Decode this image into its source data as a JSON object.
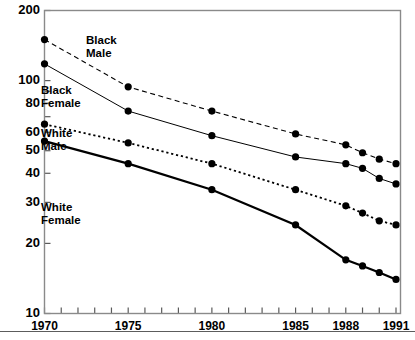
{
  "chart_data": {
    "type": "line",
    "title": "",
    "subtitle": "",
    "xlabel": "",
    "ylabel": "",
    "yscale": "log",
    "ylim": [
      10,
      200
    ],
    "xlim": [
      1970,
      1991
    ],
    "grid": false,
    "legend_position": "inline-annotations",
    "y_ticks": [
      200,
      100,
      80,
      60,
      50,
      40,
      30,
      20,
      10
    ],
    "y_tick_labels": [
      "200",
      "100",
      "80",
      "60",
      "50",
      "40",
      "30",
      "20",
      "10"
    ],
    "x_ticks": [
      1970,
      1971,
      1972,
      1973,
      1974,
      1975,
      1976,
      1977,
      1978,
      1979,
      1980,
      1981,
      1982,
      1983,
      1984,
      1985,
      1986,
      1987,
      1988,
      1989,
      1990,
      1991
    ],
    "x_tick_labels_shown": [
      "1970",
      "1975",
      "1980",
      "1985",
      "1988",
      "1991"
    ],
    "x_labeled_years": [
      1970,
      1975,
      1980,
      1985,
      1988,
      1991
    ],
    "series": [
      {
        "name": "Black Male",
        "label": "Black\nMale",
        "label_line1": "Black",
        "label_line2": "Male",
        "linestyle": "dashed",
        "color": "#000000",
        "x": [
          1970,
          1975,
          1980,
          1985,
          1988,
          1989,
          1990,
          1991
        ],
        "values": [
          150,
          94,
          74,
          59,
          53,
          49,
          46,
          44
        ]
      },
      {
        "name": "Black Female",
        "label": "Black\nFemale",
        "label_line1": "Black",
        "label_line2": "Female",
        "linestyle": "solid-thin",
        "color": "#000000",
        "x": [
          1970,
          1975,
          1980,
          1985,
          1988,
          1989,
          1990,
          1991
        ],
        "values": [
          118,
          74,
          58,
          47,
          44,
          42,
          38,
          36
        ]
      },
      {
        "name": "White Male",
        "label": "White\nMale",
        "label_line1": "White",
        "label_line2": "Male",
        "linestyle": "dotted",
        "color": "#000000",
        "x": [
          1970,
          1975,
          1980,
          1985,
          1988,
          1989,
          1990,
          1991
        ],
        "values": [
          65,
          54,
          44,
          34,
          29,
          27,
          25,
          24
        ]
      },
      {
        "name": "White Female",
        "label": "White\nFemale",
        "label_line1": "White",
        "label_line2": "Female",
        "linestyle": "solid-thick",
        "color": "#000000",
        "x": [
          1970,
          1975,
          1980,
          1985,
          1988,
          1989,
          1990,
          1991
        ],
        "values": [
          55,
          44,
          34,
          24,
          17,
          16,
          15,
          14
        ]
      }
    ],
    "annotations": [
      {
        "name": "black-male",
        "text_line1": "Black",
        "text_line2": "Male",
        "x": 86,
        "y": 44
      },
      {
        "name": "black-female",
        "text_line1": "Black",
        "text_line2": "Female",
        "x": 41,
        "y": 94
      },
      {
        "name": "white-male",
        "text_line1": "White",
        "text_line2": "Male",
        "x": 41,
        "y": 137
      },
      {
        "name": "white-female",
        "text_line1": "White",
        "text_line2": "Female",
        "x": 41,
        "y": 211
      }
    ]
  }
}
